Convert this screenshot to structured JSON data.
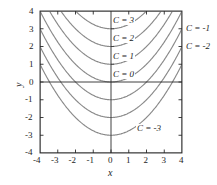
{
  "figure": {
    "background_color": "#ffffff",
    "frame_color": "#1d1d1d",
    "curve_color": "#808080",
    "axis_color": "#1d1d1d",
    "x_axis_label": "x",
    "y_axis_label": "y"
  },
  "axes": {
    "x_ticks": [
      "-4",
      "-3",
      "-2",
      "-1",
      "0",
      "1",
      "2",
      "3",
      "4"
    ],
    "y_ticks": [
      "4",
      "3",
      "2",
      "1",
      "0",
      "-1",
      "-2",
      "-3",
      "-4"
    ]
  },
  "labels": {
    "c3": "C = 3",
    "c2": "C = 2",
    "c1": "C = 1",
    "c0": "C = 0",
    "cm1": "C = -1",
    "cm2": "C = -2",
    "cm3": "C = -3"
  },
  "chart_data": {
    "type": "line",
    "title": "",
    "xlabel": "x",
    "ylabel": "y",
    "xlim": [
      -4,
      4
    ],
    "ylim": [
      -4,
      4
    ],
    "grid": false,
    "legend_position": "inline-annotations",
    "x": [
      -4,
      -3.5,
      -3,
      -2.5,
      -2,
      -1.5,
      -1,
      -0.5,
      0,
      0.5,
      1,
      1.5,
      2,
      2.5,
      3,
      3.5,
      4
    ],
    "series": [
      {
        "name": "C = 3",
        "C": 3,
        "values": [
          7,
          6.0625,
          5.25,
          4.5625,
          4,
          3.5625,
          3.25,
          3.0625,
          3,
          3.0625,
          3.25,
          3.5625,
          4,
          4.5625,
          5.25,
          6.0625,
          7
        ]
      },
      {
        "name": "C = 2",
        "C": 2,
        "values": [
          6,
          5.0625,
          4.25,
          3.5625,
          3,
          2.5625,
          2.25,
          2.0625,
          2,
          2.0625,
          2.25,
          2.5625,
          3,
          3.5625,
          4.25,
          5.0625,
          6
        ]
      },
      {
        "name": "C = 1",
        "C": 1,
        "values": [
          5,
          4.0625,
          3.25,
          2.5625,
          2,
          1.5625,
          1.25,
          1.0625,
          1,
          1.0625,
          1.25,
          1.5625,
          2,
          2.5625,
          3.25,
          4.0625,
          5
        ]
      },
      {
        "name": "C = 0",
        "C": 0,
        "values": [
          4,
          3.0625,
          2.25,
          1.5625,
          1,
          0.5625,
          0.25,
          0.0625,
          0,
          0.0625,
          0.25,
          0.5625,
          1,
          1.5625,
          2.25,
          3.0625,
          4
        ]
      },
      {
        "name": "C = -1",
        "C": -1,
        "values": [
          3,
          2.0625,
          1.25,
          0.5625,
          0,
          -0.4375,
          -0.75,
          -0.9375,
          -1,
          -0.9375,
          -0.75,
          -0.4375,
          0,
          0.5625,
          1.25,
          2.0625,
          3
        ]
      },
      {
        "name": "C = -2",
        "C": -2,
        "values": [
          2,
          1.0625,
          0.25,
          -0.4375,
          -1,
          -1.4375,
          -1.75,
          -1.9375,
          -2,
          -1.9375,
          -1.75,
          -1.4375,
          -1,
          -0.4375,
          0.25,
          1.0625,
          2
        ]
      },
      {
        "name": "C = -3",
        "C": -3,
        "values": [
          1,
          0.0625,
          -0.75,
          -1.4375,
          -2,
          -2.4375,
          -2.75,
          -2.9375,
          -3,
          -2.9375,
          -2.75,
          -2.4375,
          -2,
          -1.4375,
          -0.75,
          0.0625,
          1
        ]
      }
    ],
    "annotations": [
      {
        "text": "C = 3",
        "x": 0.1,
        "y": 3.55
      },
      {
        "text": "C = 2",
        "x": 0.1,
        "y": 2.55
      },
      {
        "text": "C = 1",
        "x": 0.1,
        "y": 1.55
      },
      {
        "text": "C = 0",
        "x": 0.1,
        "y": 0.55
      },
      {
        "text": "C = -1",
        "x": 4.3,
        "y": 3.0
      },
      {
        "text": "C = -2",
        "x": 4.3,
        "y": 2.0
      },
      {
        "text": "C = -3",
        "x": 1.6,
        "y": -2.6
      }
    ]
  }
}
